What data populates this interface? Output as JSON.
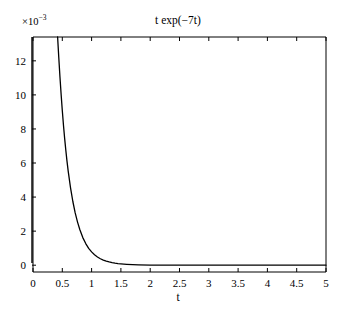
{
  "chart_data": {
    "type": "line",
    "title_display": "t exp(−7t)",
    "xlabel": "t",
    "ylabel": "",
    "y_exponent_label": "×10⁻³",
    "y_exponent_mantissa": "×10",
    "y_exponent_power": "−3",
    "y_scale": 0.001,
    "xlim": [
      0,
      5
    ],
    "ylim": [
      -0.0004,
      0.0134
    ],
    "ylim_scaled": [
      -0.4,
      13.4
    ],
    "xticks": [
      0,
      0.5,
      1,
      1.5,
      2,
      2.5,
      3,
      3.5,
      4,
      4.5,
      5
    ],
    "xticklabels": [
      "0",
      "0.5",
      "1",
      "1.5",
      "2",
      "2.5",
      "3",
      "3.5",
      "4",
      "4.5",
      "5"
    ],
    "yticks": [
      0,
      2,
      4,
      6,
      8,
      10,
      12
    ],
    "yticklabels": [
      "0",
      "2",
      "4",
      "6",
      "8",
      "10",
      "12"
    ],
    "grid": false,
    "legend": false,
    "line_color": "#000000",
    "axis_color": "#000000",
    "background": "#ffffff",
    "series": [
      {
        "name": "t exp(-7t)",
        "comment": "values in units of 1e-3 (y axis scaled by 1e-3); curve is a steep exponential decay clipped by the top of the axes",
        "x": [
          0.42,
          0.44,
          0.46,
          0.48,
          0.5,
          0.52,
          0.54,
          0.56,
          0.58,
          0.6,
          0.64,
          0.68,
          0.72,
          0.76,
          0.8,
          0.85,
          0.9,
          0.95,
          1.0,
          1.05,
          1.1,
          1.15,
          1.2,
          1.25,
          1.3,
          1.35,
          1.4,
          1.45,
          1.5,
          1.55,
          1.6,
          1.7,
          1.8,
          2.0,
          2.25,
          2.5,
          3.0,
          3.5,
          4.0,
          4.5,
          5.0
        ],
        "y": [
          13.4,
          12.2,
          11.05,
          10.02,
          9.08,
          8.22,
          7.45,
          6.75,
          6.11,
          5.54,
          4.55,
          3.74,
          3.07,
          2.53,
          2.08,
          1.62,
          1.27,
          0.99,
          0.78,
          0.61,
          0.48,
          0.38,
          0.3,
          0.24,
          0.19,
          0.15,
          0.12,
          0.095,
          0.076,
          0.061,
          0.049,
          0.032,
          0.021,
          0.009,
          0.004,
          0.002,
          0.001,
          0.0,
          0.0,
          0.0,
          0.0
        ]
      }
    ]
  },
  "axes_geometry": {
    "left_px": 33,
    "right_px": 326,
    "top_px": 37,
    "bottom_px": 272,
    "zero_line_px": 262,
    "tick_length_px": 4
  }
}
